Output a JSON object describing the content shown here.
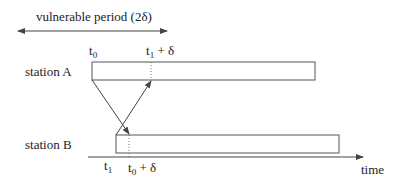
{
  "diagram": {
    "vulnerable_period_label": "vulnerable period (2δ)",
    "station_a_label": "station A",
    "station_b_label": "station B",
    "time_label": "time",
    "markers": {
      "t0": {
        "base": "t",
        "sub": "0",
        "suffix": ""
      },
      "t1_plus_delta": {
        "base": "t",
        "sub": "1",
        "suffix": " + δ"
      },
      "t1": {
        "base": "t",
        "sub": "1",
        "suffix": ""
      },
      "t0_plus_delta": {
        "base": "t",
        "sub": "0",
        "suffix": " + δ"
      }
    },
    "colors": {
      "stroke": "#555555",
      "text": "#222222"
    }
  }
}
